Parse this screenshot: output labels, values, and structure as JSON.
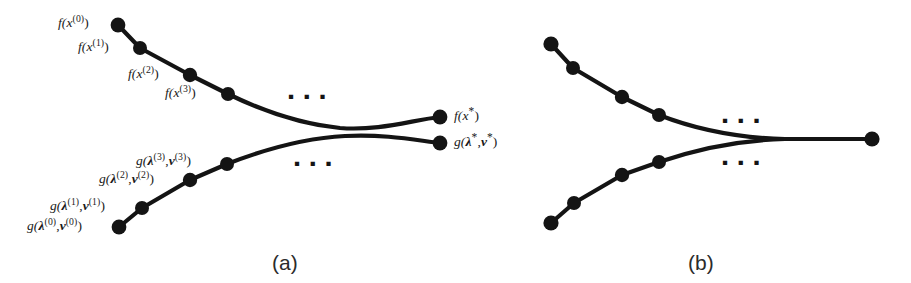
{
  "figure": {
    "type": "diagram",
    "background_color": "#ffffff",
    "ink_color": "#141414",
    "panels": [
      {
        "id": "a",
        "caption": "(a)",
        "caption_x": 272,
        "caption_y": 252,
        "ellipsis": "▪ ▪ ▪",
        "upper_curve": {
          "name": "primal-sequence-curve",
          "label_endpoint": "f(x*)",
          "points": [
            {
              "x": 118,
              "y": 25,
              "label": "f(x^(0))"
            },
            {
              "x": 140,
              "y": 48,
              "label": "f(x^(1))"
            },
            {
              "x": 190,
              "y": 75,
              "label": "f(x^(2))"
            },
            {
              "x": 228,
              "y": 94,
              "label": "f(x^(3))"
            },
            {
              "x": 440,
              "y": 117,
              "label": "f(x*)"
            }
          ]
        },
        "lower_curve": {
          "name": "dual-sequence-curve",
          "label_endpoint": "g(λ*, ν*)",
          "points": [
            {
              "x": 119,
              "y": 227,
              "label": "g(λ^(0), ν^(0))"
            },
            {
              "x": 142,
              "y": 208,
              "label": "g(λ^(1), ν^(1))"
            },
            {
              "x": 190,
              "y": 180,
              "label": "g(λ^(2), ν^(2))"
            },
            {
              "x": 227,
              "y": 164,
              "label": "g(λ^(3), ν^(3))"
            },
            {
              "x": 440,
              "y": 143,
              "label": "g(λ*, ν*)"
            }
          ]
        },
        "labels": [
          {
            "name": "label-f-x0",
            "text": "f(x^(0))",
            "x": 58,
            "y": 16
          },
          {
            "name": "label-f-x1",
            "text": "f(x^(1))",
            "x": 78,
            "y": 40
          },
          {
            "name": "label-f-x2",
            "text": "f(x^(2))",
            "x": 128,
            "y": 67
          },
          {
            "name": "label-f-x3",
            "text": "f(x^(3))",
            "x": 165,
            "y": 86
          },
          {
            "name": "label-f-xstar",
            "text": "f(x*)",
            "x": 456,
            "y": 109
          },
          {
            "name": "label-g-0",
            "text": "g(λ^(0), ν^(0))",
            "x": 27,
            "y": 219
          },
          {
            "name": "label-g-1",
            "text": "g(λ^(1), ν^(1))",
            "x": 50,
            "y": 199
          },
          {
            "name": "label-g-2",
            "text": "g(λ^(2), ν^(2))",
            "x": 99,
            "y": 172
          },
          {
            "name": "label-g-3",
            "text": "g(λ^(3), ν^(3))",
            "x": 136,
            "y": 154
          },
          {
            "name": "label-g-star",
            "text": "g(λ*, ν*)",
            "x": 456,
            "y": 135
          }
        ],
        "ellipsis_marks": [
          {
            "name": "ellipsis-primal-a",
            "x": 288,
            "y": 88
          },
          {
            "name": "ellipsis-dual-a",
            "x": 294,
            "y": 155
          }
        ]
      },
      {
        "id": "b",
        "caption": "(b)",
        "caption_x": 688,
        "caption_y": 252,
        "ellipsis": "▪ ▪ ▪",
        "upper_curve": {
          "name": "primal-sequence-curve",
          "points": [
            {
              "x": 551,
              "y": 44
            },
            {
              "x": 573,
              "y": 68
            },
            {
              "x": 622,
              "y": 97
            },
            {
              "x": 659,
              "y": 115
            },
            {
              "x": 872,
              "y": 139
            }
          ]
        },
        "lower_curve": {
          "name": "dual-sequence-curve",
          "points": [
            {
              "x": 551,
              "y": 223
            },
            {
              "x": 574,
              "y": 203
            },
            {
              "x": 622,
              "y": 175
            },
            {
              "x": 659,
              "y": 162
            },
            {
              "x": 872,
              "y": 139
            }
          ]
        },
        "labels": [],
        "ellipsis_marks": [
          {
            "name": "ellipsis-primal-b",
            "x": 722,
            "y": 112
          },
          {
            "name": "ellipsis-dual-b",
            "x": 722,
            "y": 154
          }
        ]
      }
    ]
  },
  "text": {
    "f_x0": "f(x",
    "f_x1": "f(x",
    "f_x2": "f(x",
    "f_x3": "f(x",
    "sup0": "(0)",
    "sup1": "(1)",
    "sup2": "(2)",
    "sup3": "(3)",
    "close_paren": ")",
    "star": "*",
    "g_open": "g(",
    "lambda": "λ",
    "nu": "ν",
    "comma": ",",
    "caption_a": "(a)",
    "caption_b": "(b)",
    "ellipsis": "▪ ▪ ▪"
  }
}
